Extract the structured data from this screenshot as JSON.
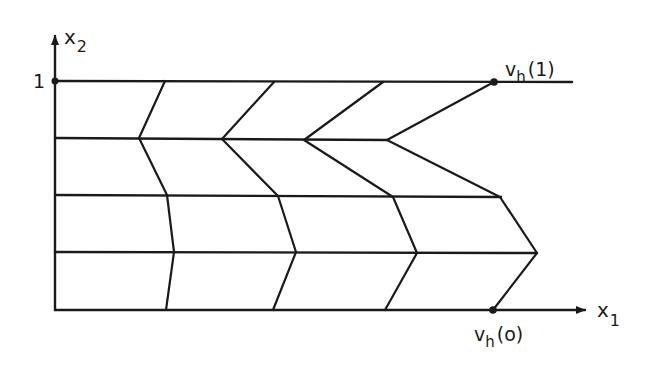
{
  "figure": {
    "axes": {
      "x_label": "x",
      "x_label_sub": "1",
      "y_label": "x",
      "y_label_sub": "2",
      "y_tick_label": "1"
    },
    "boundary_labels": {
      "top": {
        "main": "v",
        "sub": "h",
        "arg": "(1)"
      },
      "bottom": {
        "main": "v",
        "sub": "h",
        "arg": "(o)"
      }
    },
    "grid_rows": 4,
    "polylines_count": 4,
    "stroke_color": "#1a1a1a"
  }
}
